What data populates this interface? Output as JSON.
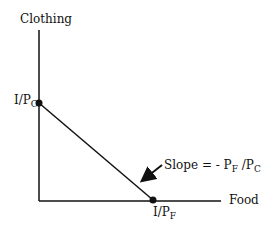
{
  "diagram": {
    "y_axis_label": "Clothing",
    "x_axis_label": "Food",
    "y_intercept": {
      "main": "I/P",
      "sub": "C"
    },
    "x_intercept": {
      "main": "I/P",
      "sub": "F"
    },
    "slope_annotation": {
      "prefix": "Slope = - P",
      "sub1": "F",
      "mid": " /P",
      "sub2": "C"
    }
  }
}
